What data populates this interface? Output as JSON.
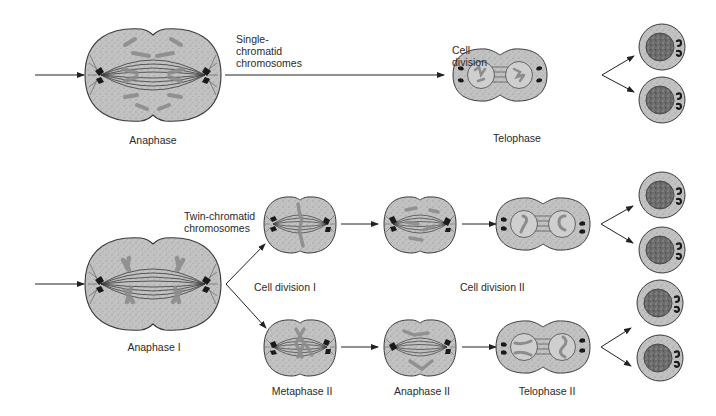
{
  "diagram": {
    "colors": {
      "cytoplasm": "#bdbdbd",
      "cytoplasm_stipple": "#8a8a8a",
      "outline": "#3a3a3a",
      "chromosome": "#8c8c8c",
      "centrosome": "#1a1a1a",
      "nucleus": "#6e6e6e",
      "nucleus_envelope": "#a9a9a9",
      "arrow": "#222222"
    },
    "top_row": {
      "name": "mitosis",
      "labels": {
        "anaphase": "Anaphase",
        "single_chromatid": "Single-\nchromatid\nchromosomes",
        "cell_division": "Cell\ndivision",
        "telophase": "Telophase"
      }
    },
    "bottom_row": {
      "name": "meiosis",
      "labels": {
        "anaphase_1": "Anaphase I",
        "twin_chromatid": "Twin-chromatid\nchromosomes",
        "cell_division_1": "Cell division  I",
        "cell_division_2": "Cell division II",
        "metaphase_2": "Metaphase II",
        "anaphase_2": "Anaphase II",
        "telophase_2": "Telophase II"
      }
    },
    "nodes": [
      {
        "id": "mitosis-anaphase",
        "stage": "Anaphase",
        "x": 153,
        "y": 75
      },
      {
        "id": "mitosis-telophase",
        "stage": "Telophase",
        "x": 500,
        "y": 75
      },
      {
        "id": "mitosis-daughter-1",
        "stage": "Daughter cell",
        "x": 662,
        "y": 47
      },
      {
        "id": "mitosis-daughter-2",
        "stage": "Daughter cell",
        "x": 662,
        "y": 100
      },
      {
        "id": "meiosis-anaphase-1",
        "stage": "Anaphase I",
        "x": 153,
        "y": 284
      },
      {
        "id": "meiosis-upper-metaphase-2",
        "stage": "Metaphase II",
        "x": 300,
        "y": 224
      },
      {
        "id": "meiosis-upper-anaphase-2",
        "stage": "Anaphase II",
        "x": 420,
        "y": 224
      },
      {
        "id": "meiosis-upper-telophase-2",
        "stage": "Telophase II",
        "x": 543,
        "y": 224
      },
      {
        "id": "meiosis-lower-metaphase-2",
        "stage": "Metaphase II",
        "x": 300,
        "y": 347
      },
      {
        "id": "meiosis-lower-anaphase-2",
        "stage": "Anaphase II",
        "x": 420,
        "y": 347
      },
      {
        "id": "meiosis-lower-telophase-2",
        "stage": "Telophase II",
        "x": 543,
        "y": 347
      },
      {
        "id": "meiosis-daughter-1",
        "stage": "Gamete",
        "x": 662,
        "y": 195
      },
      {
        "id": "meiosis-daughter-2",
        "stage": "Gamete",
        "x": 662,
        "y": 250
      },
      {
        "id": "meiosis-daughter-3",
        "stage": "Gamete",
        "x": 660,
        "y": 303
      },
      {
        "id": "meiosis-daughter-4",
        "stage": "Gamete",
        "x": 660,
        "y": 358
      }
    ],
    "edges": [
      [
        "input",
        "mitosis-anaphase"
      ],
      [
        "mitosis-anaphase",
        "mitosis-telophase"
      ],
      [
        "mitosis-telophase",
        "mitosis-daughter-1"
      ],
      [
        "mitosis-telophase",
        "mitosis-daughter-2"
      ],
      [
        "input",
        "meiosis-anaphase-1"
      ],
      [
        "meiosis-anaphase-1",
        "meiosis-upper-metaphase-2"
      ],
      [
        "meiosis-anaphase-1",
        "meiosis-lower-metaphase-2"
      ],
      [
        "meiosis-upper-metaphase-2",
        "meiosis-upper-anaphase-2"
      ],
      [
        "meiosis-upper-anaphase-2",
        "meiosis-upper-telophase-2"
      ],
      [
        "meiosis-lower-metaphase-2",
        "meiosis-lower-anaphase-2"
      ],
      [
        "meiosis-lower-anaphase-2",
        "meiosis-lower-telophase-2"
      ],
      [
        "meiosis-upper-telophase-2",
        "meiosis-daughter-1"
      ],
      [
        "meiosis-upper-telophase-2",
        "meiosis-daughter-2"
      ],
      [
        "meiosis-lower-telophase-2",
        "meiosis-daughter-3"
      ],
      [
        "meiosis-lower-telophase-2",
        "meiosis-daughter-4"
      ]
    ]
  }
}
